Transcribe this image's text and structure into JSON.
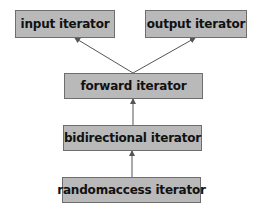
{
  "diagram": {
    "colors": {
      "box_fill": "#b9b9b9",
      "box_border": "#6e6e6e",
      "edge": "#555555",
      "text": "#111111"
    },
    "nodes": [
      {
        "id": "input",
        "label": "input iterator",
        "x": 15,
        "y": 10,
        "w": 100,
        "h": 28
      },
      {
        "id": "output",
        "label": "output iterator",
        "x": 145,
        "y": 10,
        "w": 102,
        "h": 28
      },
      {
        "id": "forward",
        "label": "forward iterator",
        "x": 64,
        "y": 73,
        "w": 139,
        "h": 26
      },
      {
        "id": "bidirectional",
        "label": "bidirectional iterator",
        "x": 63,
        "y": 125,
        "w": 139,
        "h": 26
      },
      {
        "id": "randomaccess",
        "label": "randomaccess iterator",
        "x": 62,
        "y": 177,
        "w": 139,
        "h": 26
      }
    ],
    "edges": [
      {
        "from": "forward",
        "to": "input"
      },
      {
        "from": "forward",
        "to": "output"
      },
      {
        "from": "bidirectional",
        "to": "forward"
      },
      {
        "from": "randomaccess",
        "to": "bidirectional"
      }
    ]
  }
}
